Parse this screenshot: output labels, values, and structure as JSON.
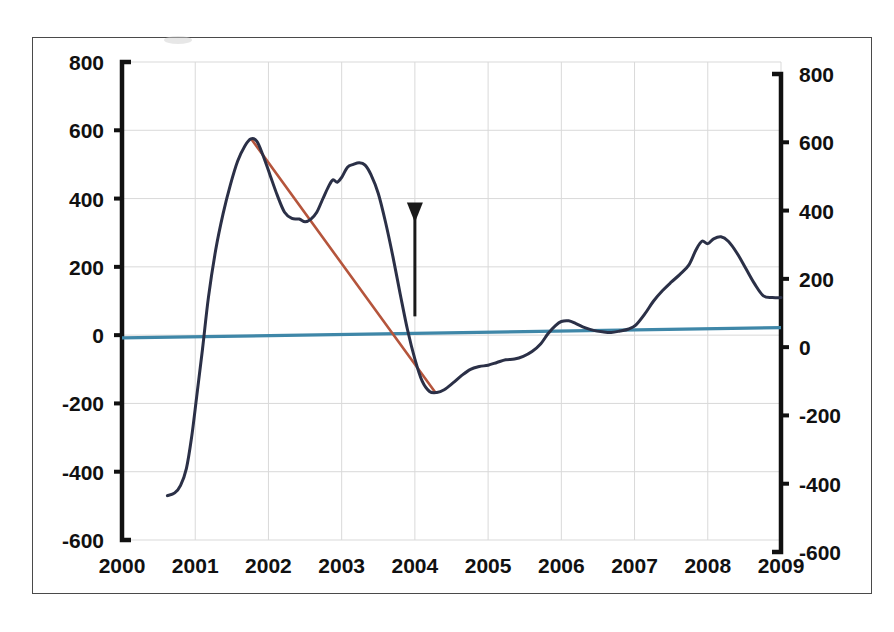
{
  "figure": {
    "background_color": "#ffffff",
    "frame_color": "#4a4a4a",
    "has_title": false,
    "title": ""
  },
  "colors": {
    "main_series": "#2b3047",
    "trend_line": "#b5553c",
    "zero_line": "#3f87a8",
    "gridline": "#d9d9d9",
    "axis": "#111111",
    "annotation": "#1a1a1a"
  },
  "chart_data": {
    "type": "line",
    "title": "",
    "xlabel": "",
    "ylabel": "",
    "xlim": [
      2000,
      2009
    ],
    "ylim": [
      -600,
      800
    ],
    "xticks": [
      "2000",
      "2001",
      "2002",
      "2003",
      "2004",
      "2005",
      "2006",
      "2007",
      "2008",
      "2009"
    ],
    "yticks": [
      "800",
      "600",
      "400",
      "200",
      "0",
      "-200",
      "-400",
      "-600"
    ],
    "ytick_values": [
      800,
      600,
      400,
      200,
      0,
      -200,
      -400,
      -600
    ],
    "right_axis": {
      "visible": true,
      "ticks": [
        "800",
        "600",
        "400",
        "200",
        "0",
        "-200",
        "-400",
        "-600"
      ],
      "tick_values": [
        800,
        600,
        400,
        200,
        0,
        -200,
        -400,
        -600
      ],
      "note": "mirrored duplicate scale, drawn slightly offset downward relative to left axis"
    },
    "grid": true,
    "grid_axis": "both",
    "legend": false,
    "legend_position": "none",
    "series": [
      {
        "name": "main-series",
        "color": "#2b3047",
        "points": [
          [
            2000.62,
            -470
          ],
          [
            2000.72,
            -462
          ],
          [
            2000.8,
            -440
          ],
          [
            2000.88,
            -390
          ],
          [
            2000.95,
            -300
          ],
          [
            2001.02,
            -180
          ],
          [
            2001.1,
            -40
          ],
          [
            2001.18,
            110
          ],
          [
            2001.28,
            250
          ],
          [
            2001.38,
            355
          ],
          [
            2001.48,
            440
          ],
          [
            2001.58,
            510
          ],
          [
            2001.68,
            555
          ],
          [
            2001.76,
            575
          ],
          [
            2001.84,
            568
          ],
          [
            2001.92,
            530
          ],
          [
            2002.02,
            470
          ],
          [
            2002.12,
            410
          ],
          [
            2002.22,
            360
          ],
          [
            2002.32,
            342
          ],
          [
            2002.42,
            340
          ],
          [
            2002.5,
            332
          ],
          [
            2002.58,
            340
          ],
          [
            2002.66,
            360
          ],
          [
            2002.74,
            398
          ],
          [
            2002.82,
            435
          ],
          [
            2002.88,
            455
          ],
          [
            2002.94,
            448
          ],
          [
            2003.0,
            462
          ],
          [
            2003.08,
            492
          ],
          [
            2003.16,
            500
          ],
          [
            2003.24,
            505
          ],
          [
            2003.32,
            498
          ],
          [
            2003.4,
            470
          ],
          [
            2003.5,
            415
          ],
          [
            2003.6,
            330
          ],
          [
            2003.7,
            230
          ],
          [
            2003.8,
            120
          ],
          [
            2003.9,
            15
          ],
          [
            2004.0,
            -70
          ],
          [
            2004.1,
            -135
          ],
          [
            2004.2,
            -165
          ],
          [
            2004.3,
            -168
          ],
          [
            2004.4,
            -160
          ],
          [
            2004.52,
            -140
          ],
          [
            2004.64,
            -118
          ],
          [
            2004.76,
            -100
          ],
          [
            2004.88,
            -92
          ],
          [
            2005.0,
            -88
          ],
          [
            2005.12,
            -80
          ],
          [
            2005.24,
            -72
          ],
          [
            2005.36,
            -70
          ],
          [
            2005.48,
            -62
          ],
          [
            2005.6,
            -48
          ],
          [
            2005.72,
            -25
          ],
          [
            2005.82,
            5
          ],
          [
            2005.92,
            28
          ],
          [
            2006.0,
            40
          ],
          [
            2006.1,
            42
          ],
          [
            2006.2,
            34
          ],
          [
            2006.32,
            22
          ],
          [
            2006.44,
            14
          ],
          [
            2006.56,
            10
          ],
          [
            2006.68,
            8
          ],
          [
            2006.8,
            12
          ],
          [
            2006.92,
            18
          ],
          [
            2007.02,
            30
          ],
          [
            2007.14,
            62
          ],
          [
            2007.26,
            100
          ],
          [
            2007.38,
            130
          ],
          [
            2007.5,
            155
          ],
          [
            2007.62,
            178
          ],
          [
            2007.74,
            205
          ],
          [
            2007.84,
            250
          ],
          [
            2007.92,
            275
          ],
          [
            2008.0,
            268
          ],
          [
            2008.08,
            282
          ],
          [
            2008.18,
            288
          ],
          [
            2008.28,
            275
          ],
          [
            2008.4,
            240
          ],
          [
            2008.52,
            195
          ],
          [
            2008.64,
            150
          ],
          [
            2008.76,
            115
          ],
          [
            2008.88,
            110
          ],
          [
            2009.0,
            110
          ]
        ]
      },
      {
        "name": "trend-line",
        "color": "#b5553c",
        "style": "straight",
        "points": [
          [
            2001.77,
            573
          ],
          [
            2004.28,
            -168
          ]
        ]
      },
      {
        "name": "zero-reference-line",
        "color": "#3f87a8",
        "style": "straight",
        "points": [
          [
            2000.0,
            -8
          ],
          [
            2009.0,
            22
          ]
        ]
      }
    ],
    "annotations": [
      {
        "type": "arrow",
        "name": "downward-arrow",
        "x": 2004.0,
        "y_start": 330,
        "y_end": 55,
        "direction": "down",
        "color": "#1a1a1a"
      }
    ]
  }
}
